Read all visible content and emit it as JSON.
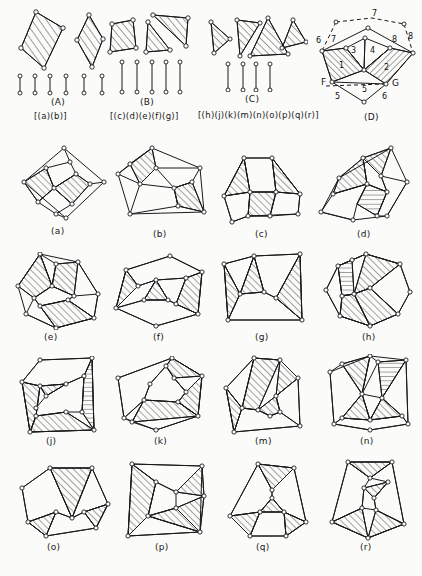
{
  "page": {
    "kind": "mathematical-figure-plate",
    "background_color": "#fbfbfa",
    "ink_color": "#1a1a1a",
    "node_fill": "#ffffff",
    "hatch_color": "#2a2a2a"
  },
  "top_groups": [
    {
      "id": "A",
      "group_label": "(A)",
      "set_label": "[(a)(b)]",
      "member_labels": [
        "(a)",
        "(b)"
      ],
      "shape_count": 2,
      "edge_stub_count": 6,
      "shapes": [
        {
          "name": "hatched-quadrilateral-1",
          "sides": 4,
          "hatched": true,
          "hatch_dir": "/"
        },
        {
          "name": "hatched-rhombus-2",
          "sides": 4,
          "hatched": true,
          "hatch_dir": "/"
        }
      ]
    },
    {
      "id": "B",
      "group_label": "(B)",
      "set_label": "[(c)(d)(e)(f)(g)]",
      "member_labels": [
        "(c)",
        "(d)",
        "(e)",
        "(f)",
        "(g)"
      ],
      "shape_count": 3,
      "edge_stub_count": 5,
      "shapes": [
        {
          "name": "hatched-square",
          "sides": 4,
          "hatched": true,
          "hatch_dir": "/"
        },
        {
          "name": "hatched-triangle-left",
          "sides": 3,
          "hatched": true,
          "hatch_dir": "/"
        },
        {
          "name": "hatched-triangle-right",
          "sides": 3,
          "hatched": true,
          "hatch_dir": "/"
        }
      ]
    },
    {
      "id": "C",
      "group_label": "(C)",
      "set_label": "[(h)(j)(k)(m)(n)(o)(p)(q)(r)]",
      "member_labels": [
        "(h)",
        "(j)",
        "(k)",
        "(m)",
        "(n)",
        "(o)",
        "(p)",
        "(q)",
        "(r)"
      ],
      "shape_count": 4,
      "edge_stub_count": 4,
      "shapes": [
        {
          "name": "hatched-triangle-1",
          "sides": 3,
          "hatched": true,
          "hatch_dir": "/"
        },
        {
          "name": "hatched-triangle-2",
          "sides": 3,
          "hatched": true,
          "hatch_dir": "/"
        },
        {
          "name": "hatched-triangle-3",
          "sides": 3,
          "hatched": true,
          "hatch_dir": "/"
        },
        {
          "name": "hatched-triangle-4",
          "sides": 3,
          "hatched": true,
          "hatch_dir": "/"
        }
      ]
    },
    {
      "id": "D",
      "group_label": "(D)",
      "set_label": "",
      "region_numbers": [
        "1",
        "2",
        "3",
        "4"
      ],
      "edge_numbers": [
        "5",
        "5",
        "6",
        "6",
        "7",
        "7",
        "8",
        "8"
      ],
      "vertex_labels": [
        "F",
        "G"
      ],
      "dashed_edges": true,
      "description": "labelled polygon with numbered regions and dashed outer arcs"
    }
  ],
  "grid": {
    "rows": 4,
    "cols": 4,
    "labels": [
      [
        "(a)",
        "(b)",
        "(c)",
        "(d)"
      ],
      [
        "(e)",
        "(f)",
        "(g)",
        "(h)"
      ],
      [
        "(j)",
        "(k)",
        "(m)",
        "(n)"
      ],
      [
        "(o)",
        "(p)",
        "(q)",
        "(r)"
      ]
    ],
    "figures": [
      {
        "label": "(a)",
        "nodes": 10,
        "hatched_regions": 2,
        "outline": "rotated-square"
      },
      {
        "label": "(b)",
        "nodes": 8,
        "hatched_regions": 2,
        "outline": "skew-pentagon"
      },
      {
        "label": "(c)",
        "nodes": 10,
        "hatched_regions": 3,
        "outline": "broad-heptagon"
      },
      {
        "label": "(d)",
        "nodes": 9,
        "hatched_regions": 3,
        "outline": "slanted-hexagon"
      },
      {
        "label": "(e)",
        "nodes": 9,
        "hatched_regions": 3,
        "outline": "tall-hexagon"
      },
      {
        "label": "(f)",
        "nodes": 9,
        "hatched_regions": 3,
        "outline": "house-pentagon"
      },
      {
        "label": "(g)",
        "nodes": 8,
        "hatched_regions": 3,
        "outline": "arch-pentagon"
      },
      {
        "label": "(h)",
        "nodes": 10,
        "hatched_regions": 4,
        "outline": "octagon"
      },
      {
        "label": "(j)",
        "nodes": 9,
        "hatched_regions": 4,
        "outline": "trapezium"
      },
      {
        "label": "(k)",
        "nodes": 9,
        "hatched_regions": 3,
        "outline": "pentagon"
      },
      {
        "label": "(m)",
        "nodes": 10,
        "hatched_regions": 4,
        "outline": "irregular-hexagon"
      },
      {
        "label": "(n)",
        "nodes": 10,
        "hatched_regions": 4,
        "outline": "hourglass-hexagon"
      },
      {
        "label": "(o)",
        "nodes": 10,
        "hatched_regions": 3,
        "outline": "heptagon"
      },
      {
        "label": "(p)",
        "nodes": 9,
        "hatched_regions": 4,
        "outline": "bowtie-quad"
      },
      {
        "label": "(q)",
        "nodes": 10,
        "hatched_regions": 3,
        "outline": "hexagon"
      },
      {
        "label": "(r)",
        "nodes": 10,
        "hatched_regions": 4,
        "outline": "tall-hexagon"
      }
    ]
  }
}
